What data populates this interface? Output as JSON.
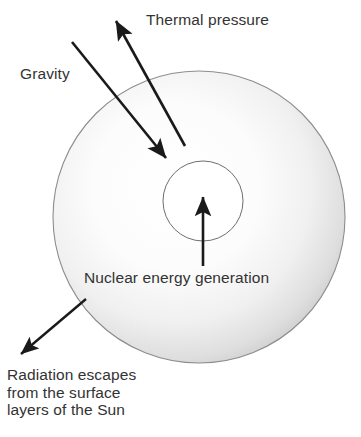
{
  "figure": {
    "type": "diagram",
    "background_color": "#ffffff",
    "text_color": "#333333",
    "stroke_color": "#1a1a1a"
  },
  "labels": {
    "thermal_pressure": "Thermal pressure",
    "gravity": "Gravity",
    "nuclear_energy": "Nuclear energy generation",
    "radiation_line1": "Radiation escapes",
    "radiation_line2": "from the surface",
    "radiation_line3": "layers of the Sun"
  },
  "shapes": {
    "sun_body": {
      "name": "sun-disc",
      "cx": 199,
      "cy": 217,
      "r": 146,
      "fill_center": "#ffffff",
      "fill_edge": "#c9c9c9",
      "outline": "#8a8a8a"
    },
    "core": {
      "name": "sun-core",
      "cx": 203,
      "cy": 201,
      "r": 40,
      "fill": "#ffffff",
      "outline": "#6b6b6b"
    }
  },
  "arrows": [
    {
      "name": "thermal-pressure-arrow",
      "label": "Thermal pressure",
      "direction": "up-left",
      "x1": 185,
      "y1": 146,
      "x2": 116,
      "y2": 21
    },
    {
      "name": "gravity-arrow",
      "label": "Gravity",
      "direction": "down-right",
      "x1": 72,
      "y1": 42,
      "x2": 166,
      "y2": 158
    },
    {
      "name": "nuclear-energy-arrow",
      "label": "Nuclear energy generation",
      "direction": "up",
      "x1": 203,
      "y1": 266,
      "x2": 203,
      "y2": 197
    },
    {
      "name": "radiation-arrow",
      "label": "Radiation escapes from the surface layers of the Sun",
      "direction": "down-left",
      "x1": 86,
      "y1": 299,
      "x2": 21,
      "y2": 354
    }
  ]
}
